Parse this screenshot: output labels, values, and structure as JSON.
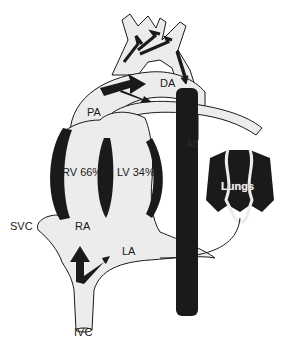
{
  "diagram": {
    "type": "fetal-circulation",
    "labels": {
      "pa": "PA",
      "da": "DA",
      "ao": "Ao",
      "rv": "RV 66%",
      "lv": "LV 34%",
      "lungs": "Lungs",
      "svc": "SVC",
      "ra": "RA",
      "la": "LA",
      "ivc": "IVC"
    },
    "colors": {
      "vessel_fill": "#ececec",
      "outline": "#1a1a1a",
      "muscle": "#1a1a1a",
      "background": "#ffffff"
    }
  }
}
